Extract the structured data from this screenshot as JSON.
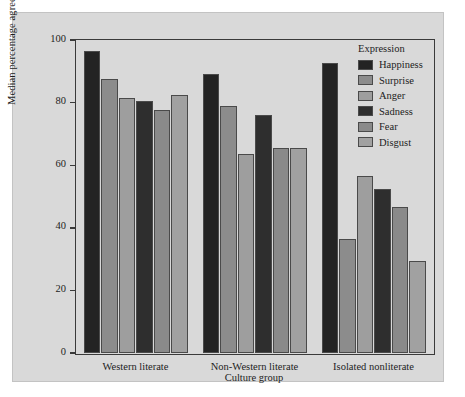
{
  "chart_data": {
    "type": "bar",
    "title": "",
    "xlabel": "Culture group",
    "ylabel": "Median percentage agreement",
    "categories": [
      "Western literate",
      "Non-Western literate",
      "Isolated nonliterate"
    ],
    "series": [
      {
        "name": "Happiness",
        "color": "#232323",
        "values": [
          96.5,
          89.0,
          92.5
        ]
      },
      {
        "name": "Surprise",
        "color": "#8c8c8c",
        "values": [
          87.5,
          79.0,
          36.5
        ]
      },
      {
        "name": "Anger",
        "color": "#9e9e9e",
        "values": [
          81.5,
          63.5,
          56.5
        ]
      },
      {
        "name": "Sadness",
        "color": "#2e2e2e",
        "values": [
          80.5,
          76.0,
          52.5
        ]
      },
      {
        "name": "Fear",
        "color": "#8a8a8a",
        "values": [
          77.5,
          65.5,
          46.5
        ]
      },
      {
        "name": "Disgust",
        "color": "#a1a1a1",
        "values": [
          82.5,
          65.5,
          29.5
        ]
      }
    ],
    "ylim": [
      0,
      100
    ],
    "yticks": [
      0,
      20,
      40,
      60,
      80,
      100
    ],
    "ytick_labels": [
      "0",
      "20",
      "40",
      "60",
      "80",
      "100"
    ],
    "grid": false,
    "legend_position": "top-right",
    "legend_title": "Expression",
    "background_color": "#d9d9d9",
    "axis_color": "#3a3a3a"
  }
}
